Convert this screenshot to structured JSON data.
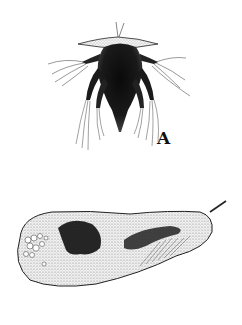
{
  "figures": [
    {
      "id": "A",
      "label": "A",
      "subject": "nauplius-larva-illustration"
    },
    {
      "id": "B",
      "label": "B",
      "subject": "elongated-protist-cell-illustration"
    }
  ],
  "colors": {
    "ink": "#111111",
    "stipple": "#555555",
    "background": "#ffffff"
  }
}
